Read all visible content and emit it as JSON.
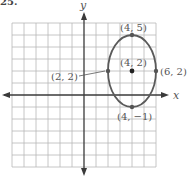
{
  "problem_number": "25.",
  "axes": {
    "x_label": "x",
    "y_label": "y",
    "origin_px": [
      84,
      95
    ],
    "unit_px": 12,
    "grid_range": {
      "x": [
        -6,
        6
      ],
      "y": [
        -6,
        6
      ]
    }
  },
  "ellipse": {
    "center": [
      4,
      2
    ],
    "semi_axis_x": 2,
    "semi_axis_y": 3
  },
  "points": [
    {
      "id": "top",
      "coords": [
        4,
        5
      ],
      "label": "(4, 5)"
    },
    {
      "id": "center",
      "coords": [
        4,
        2
      ],
      "label": "(4, 2)"
    },
    {
      "id": "left",
      "coords": [
        2,
        2
      ],
      "label": "(2, 2)"
    },
    {
      "id": "right",
      "coords": [
        6,
        2
      ],
      "label": "(6, 2)"
    },
    {
      "id": "bottom",
      "coords": [
        4,
        -1
      ],
      "label": "(4, −1)"
    }
  ],
  "colors": {
    "grid": "#b8b8b8",
    "axis": "#3a3a3a",
    "curve": "#5a5a5a",
    "text": "#555555"
  }
}
